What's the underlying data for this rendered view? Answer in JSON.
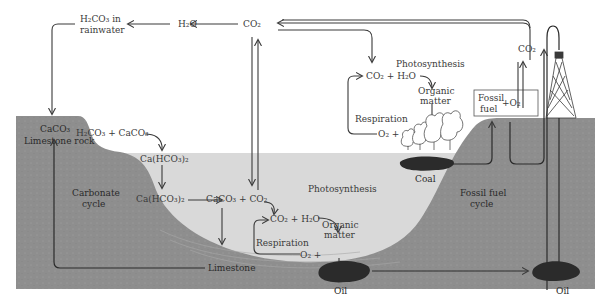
{
  "figure": {
    "colors": {
      "ground": "#8e8e8e",
      "water": "#d9d9d9",
      "sky": "#ffffff",
      "deposit": "#2b2b2b",
      "text": "#3a3a3a"
    }
  },
  "atmosphere": {
    "h2co3_rain_line1": "H₂CO₃ in",
    "h2co3_rain_line2": "rainwater",
    "h2o": "H₂O",
    "co2_top": "CO₂",
    "co2_chimney": "CO₂"
  },
  "carbonate_cycle": {
    "reaction": "H₂CO₃ + CaCO₃",
    "bicarbonate_1": "Ca(HCO₃)₂",
    "bicarbonate_2": "Ca(HCO₃)₂",
    "precipitate": "CaCO₃ + CO₂",
    "rock_formula": "CaCO₃",
    "rock_label": "Limestone rock",
    "cycle_line1": "Carbonate",
    "cycle_line2": "cycle",
    "limestone": "Limestone"
  },
  "land_biology": {
    "reactants": "CO₂ + H₂O",
    "photosynthesis": "Photosynthesis",
    "organic_line1": "Organic",
    "organic_line2": "matter",
    "respiration": "Respiration",
    "o2": "O₂ +"
  },
  "water_biology": {
    "reactants": "CO₂ + H₂O",
    "photosynthesis": "Photosynthesis",
    "respiration": "Respiration",
    "o2": "O₂ +",
    "organic_line1": "Organic",
    "organic_line2": "matter"
  },
  "fossil_fuel": {
    "fuel_line1": "Fossil",
    "fuel_line2": "fuel",
    "o2": "+O₂",
    "coal": "Coal",
    "oil_sea": "Oil",
    "oil_well": "Oil",
    "cycle_line1": "Fossil fuel",
    "cycle_line2": "cycle"
  }
}
